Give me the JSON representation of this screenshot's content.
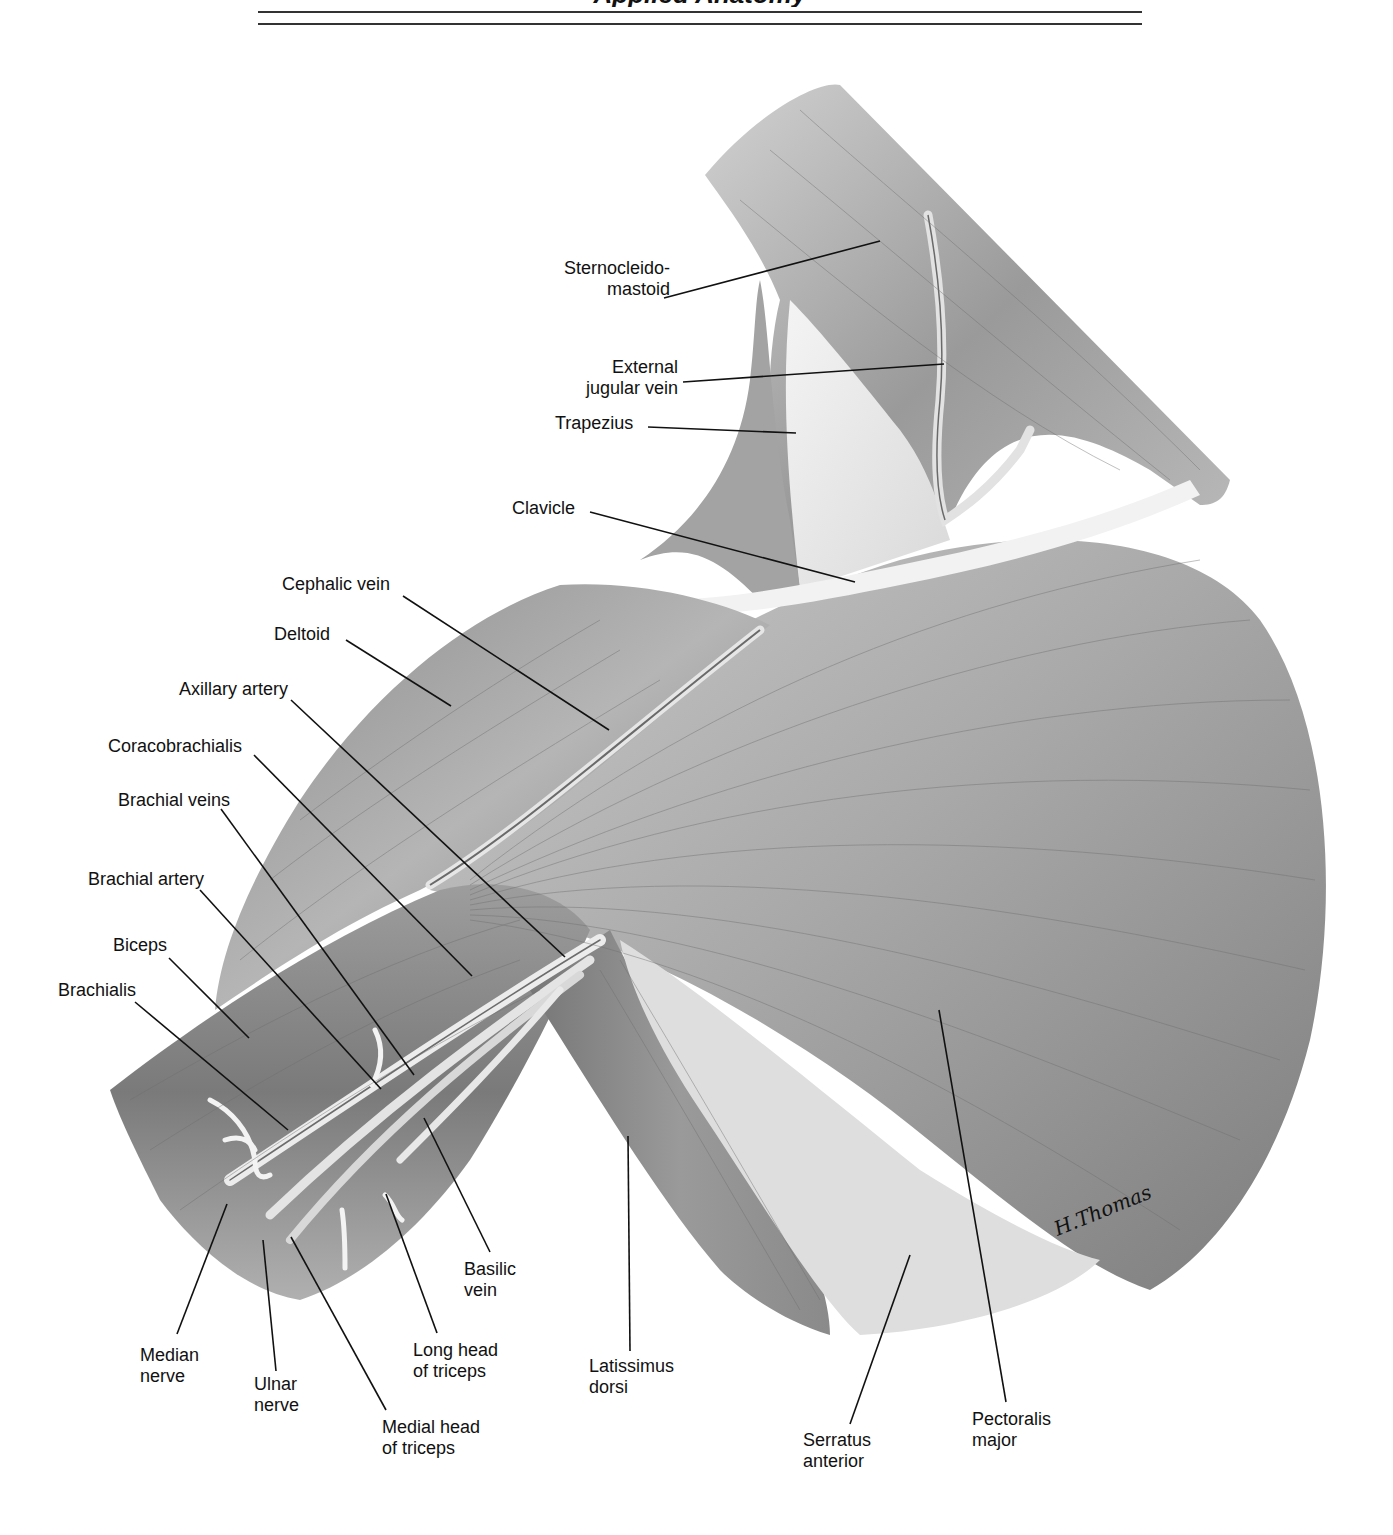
{
  "header": {
    "title_fragment": "Applied Anatomy",
    "rules": 2
  },
  "figure": {
    "signature": "H.Thomas",
    "palette": {
      "ink": "#111111",
      "muscle_dark": "#6e6e6e",
      "muscle_mid": "#9a9a9a",
      "muscle_light": "#cfcfcf",
      "fascia": "#eeeeee",
      "background": "#ffffff"
    }
  },
  "labels": [
    {
      "id": "sternocleidomastoid",
      "lines": [
        "Sternocleido-",
        "mastoid"
      ],
      "x": 530,
      "y": 258,
      "w": 140,
      "align": "right",
      "leader": [
        [
          664,
          298
        ],
        [
          880,
          241
        ]
      ]
    },
    {
      "id": "external-jugular-vein",
      "lines": [
        "External",
        "jugular vein"
      ],
      "x": 540,
      "y": 357,
      "w": 138,
      "align": "right",
      "leader": [
        [
          683,
          382
        ],
        [
          944,
          364
        ]
      ]
    },
    {
      "id": "trapezius",
      "lines": [
        "Trapezius"
      ],
      "x": 555,
      "y": 413,
      "w": 90,
      "align": "left",
      "leader": [
        [
          648,
          427
        ],
        [
          796,
          433
        ]
      ]
    },
    {
      "id": "clavicle",
      "lines": [
        "Clavicle"
      ],
      "x": 512,
      "y": 498,
      "w": 80,
      "align": "left",
      "leader": [
        [
          590,
          512
        ],
        [
          855,
          582
        ]
      ]
    },
    {
      "id": "cephalic-vein",
      "lines": [
        "Cephalic vein"
      ],
      "x": 282,
      "y": 574,
      "w": 125,
      "align": "left",
      "leader": [
        [
          403,
          596
        ],
        [
          609,
          730
        ]
      ]
    },
    {
      "id": "deltoid",
      "lines": [
        "Deltoid"
      ],
      "x": 274,
      "y": 624,
      "w": 70,
      "align": "left",
      "leader": [
        [
          346,
          640
        ],
        [
          451,
          706
        ]
      ]
    },
    {
      "id": "axillary-artery",
      "lines": [
        "Axillary artery"
      ],
      "x": 179,
      "y": 679,
      "w": 130,
      "align": "left",
      "leader": [
        [
          291,
          700
        ],
        [
          565,
          957
        ]
      ]
    },
    {
      "id": "coracobrachialis",
      "lines": [
        "Coracobrachialis"
      ],
      "x": 108,
      "y": 736,
      "w": 150,
      "align": "left",
      "leader": [
        [
          254,
          755
        ],
        [
          472,
          976
        ]
      ]
    },
    {
      "id": "brachial-veins",
      "lines": [
        "Brachial veins"
      ],
      "x": 118,
      "y": 790,
      "w": 130,
      "align": "left",
      "leader": [
        [
          221,
          809
        ],
        [
          414,
          1075
        ]
      ]
    },
    {
      "id": "brachial-artery",
      "lines": [
        "Brachial artery"
      ],
      "x": 88,
      "y": 869,
      "w": 135,
      "align": "left",
      "leader": [
        [
          200,
          890
        ],
        [
          381,
          1089
        ]
      ]
    },
    {
      "id": "biceps",
      "lines": [
        "Biceps"
      ],
      "x": 113,
      "y": 935,
      "w": 70,
      "align": "left",
      "leader": [
        [
          169,
          958
        ],
        [
          249,
          1038
        ]
      ]
    },
    {
      "id": "brachialis",
      "lines": [
        "Brachialis"
      ],
      "x": 58,
      "y": 980,
      "w": 95,
      "align": "left",
      "leader": [
        [
          135,
          1002
        ],
        [
          288,
          1130
        ]
      ]
    },
    {
      "id": "median-nerve",
      "lines": [
        "Median",
        "nerve"
      ],
      "x": 140,
      "y": 1345,
      "w": 80,
      "align": "left",
      "leader": [
        [
          177,
          1334
        ],
        [
          227,
          1204
        ]
      ]
    },
    {
      "id": "ulnar-nerve",
      "lines": [
        "Ulnar",
        "nerve"
      ],
      "x": 254,
      "y": 1374,
      "w": 60,
      "align": "left",
      "leader": [
        [
          276,
          1371
        ],
        [
          263,
          1240
        ]
      ]
    },
    {
      "id": "medial-head-of-triceps",
      "lines": [
        "Medial head",
        "of triceps"
      ],
      "x": 382,
      "y": 1417,
      "w": 120,
      "align": "left",
      "leader": [
        [
          386,
          1410
        ],
        [
          291,
          1237
        ]
      ]
    },
    {
      "id": "long-head-of-triceps",
      "lines": [
        "Long head",
        "of triceps"
      ],
      "x": 413,
      "y": 1340,
      "w": 110,
      "align": "left",
      "leader": [
        [
          437,
          1333
        ],
        [
          386,
          1194
        ]
      ]
    },
    {
      "id": "basilic-vein",
      "lines": [
        "Basilic",
        "vein"
      ],
      "x": 464,
      "y": 1259,
      "w": 70,
      "align": "left",
      "leader": [
        [
          490,
          1252
        ],
        [
          424,
          1118
        ]
      ]
    },
    {
      "id": "latissimus-dorsi",
      "lines": [
        "Latissimus",
        "dorsi"
      ],
      "x": 589,
      "y": 1356,
      "w": 100,
      "align": "left",
      "leader": [
        [
          630,
          1351
        ],
        [
          628,
          1136
        ]
      ]
    },
    {
      "id": "serratus-anterior",
      "lines": [
        "Serratus",
        "anterior"
      ],
      "x": 803,
      "y": 1430,
      "w": 90,
      "align": "left",
      "leader": [
        [
          850,
          1424
        ],
        [
          910,
          1255
        ]
      ]
    },
    {
      "id": "pectoralis-major",
      "lines": [
        "Pectoralis",
        "major"
      ],
      "x": 972,
      "y": 1409,
      "w": 100,
      "align": "left",
      "leader": [
        [
          1006,
          1402
        ],
        [
          939,
          1010
        ]
      ]
    }
  ]
}
